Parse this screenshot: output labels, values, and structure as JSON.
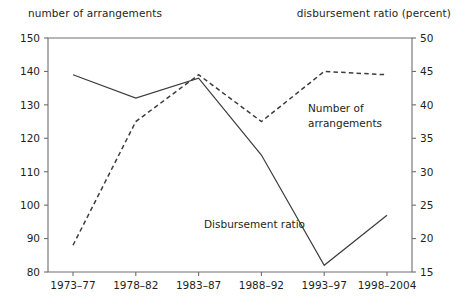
{
  "chart_data": {
    "type": "line",
    "title": "",
    "categories": [
      "1973–77",
      "1978–82",
      "1983–87",
      "1988–92",
      "1993–97",
      "1998–2004"
    ],
    "xlabel": "",
    "left_axis": {
      "label": "number of arrangements",
      "ticks": [
        80,
        90,
        100,
        110,
        120,
        130,
        140,
        150
      ],
      "ylim": [
        80,
        150
      ]
    },
    "right_axis": {
      "label": "disbursement ratio (percent)",
      "ticks": [
        15,
        20,
        25,
        30,
        35,
        40,
        45,
        50
      ],
      "ylim": [
        15,
        50
      ]
    },
    "grid": false,
    "legend_position": "inline-annotation",
    "series": [
      {
        "name": "Number of arrangements",
        "axis": "left",
        "style": "solid",
        "annotation": "Number of arrangements",
        "values": [
          139,
          132,
          138,
          115,
          82,
          97
        ]
      },
      {
        "name": "Disbursement ratio",
        "axis": "right",
        "style": "dashed",
        "annotation": "Disbursement ratio",
        "values": [
          19,
          37.5,
          44.5,
          37.5,
          45,
          44.5
        ]
      }
    ]
  },
  "annotations": {
    "arrangements_line1": "Number of",
    "arrangements_line2": "arrangements",
    "disbursement": "Disbursement ratio"
  }
}
